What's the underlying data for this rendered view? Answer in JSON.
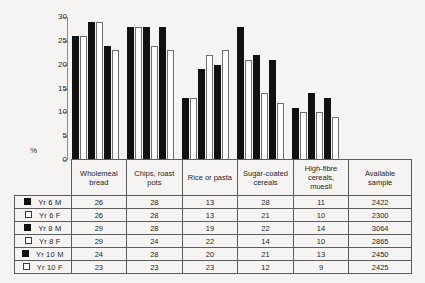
{
  "chart_data": {
    "type": "bar",
    "title": "",
    "xlabel": "",
    "ylabel": "%",
    "ylim": [
      0,
      30
    ],
    "yticks": [
      "0",
      "5",
      "10",
      "15",
      "20",
      "25",
      "30"
    ],
    "grid": false,
    "legend_position": "table-left-column",
    "categories": [
      "Wholemeal bread",
      "Chips, roast pots",
      "Rice or pasta",
      "Sugar-coated cereals",
      "High-fibre cereals, muesli"
    ],
    "series": [
      {
        "name": "Yr 6 M",
        "values": [
          26,
          28,
          13,
          28,
          11
        ]
      },
      {
        "name": "Yr 6 F",
        "values": [
          26,
          28,
          13,
          21,
          10
        ]
      },
      {
        "name": "Yr 8 M",
        "values": [
          29,
          28,
          19,
          22,
          14
        ]
      },
      {
        "name": "Yr 8 F",
        "values": [
          29,
          24,
          22,
          14,
          10
        ]
      },
      {
        "name": "Yr 10 M",
        "values": [
          24,
          28,
          20,
          21,
          13
        ]
      },
      {
        "name": "Yr 10 F",
        "values": [
          23,
          23,
          23,
          12,
          9
        ]
      }
    ]
  },
  "axis": {
    "y_label": "%",
    "ticks": [
      {
        "value": 30,
        "label": "30"
      },
      {
        "value": 25,
        "label": "25"
      },
      {
        "value": 20,
        "label": "20"
      },
      {
        "value": 15,
        "label": "15"
      },
      {
        "value": 10,
        "label": "10"
      },
      {
        "value": 5,
        "label": "5"
      },
      {
        "value": 0,
        "label": "0"
      }
    ]
  },
  "table": {
    "headers": [
      {
        "line1": "Wholemeal",
        "line2": "bread"
      },
      {
        "line1": "Chips, roast",
        "line2": "pots"
      },
      {
        "line1": "Rice or pasta",
        "line2": ""
      },
      {
        "line1": "Sugar-coated",
        "line2": "cereals"
      },
      {
        "line1": "High-fibre",
        "line2": "cereals,",
        "line3": "muesli"
      },
      {
        "line1": "Available",
        "line2": "sample"
      }
    ],
    "rows": [
      {
        "label": "Yr 6 M",
        "marker": "filled",
        "cells": [
          "26",
          "28",
          "13",
          "28",
          "11",
          "2422"
        ]
      },
      {
        "label": "Yr 6 F",
        "marker": "open",
        "cells": [
          "26",
          "28",
          "13",
          "21",
          "10",
          "2300"
        ]
      },
      {
        "label": "Yr 8 M",
        "marker": "filled",
        "cells": [
          "29",
          "28",
          "19",
          "22",
          "14",
          "3064"
        ]
      },
      {
        "label": "Yr 8 F",
        "marker": "open",
        "cells": [
          "29",
          "24",
          "22",
          "14",
          "10",
          "2865"
        ]
      },
      {
        "label": "Yr 10 M",
        "marker": "filled",
        "cells": [
          "24",
          "28",
          "20",
          "21",
          "13",
          "2450"
        ]
      },
      {
        "label": "Yr 10 F",
        "marker": "open",
        "cells": [
          "23",
          "23",
          "23",
          "12",
          "9",
          "2425"
        ]
      }
    ]
  },
  "colors": {
    "male_bar": "#111111",
    "female_bar": "#fdfdfb",
    "female_outline": "#6f6f6f",
    "axis": "#8d8d8d",
    "table_border": "#5d5d5d",
    "background": "#f5f4f2"
  }
}
